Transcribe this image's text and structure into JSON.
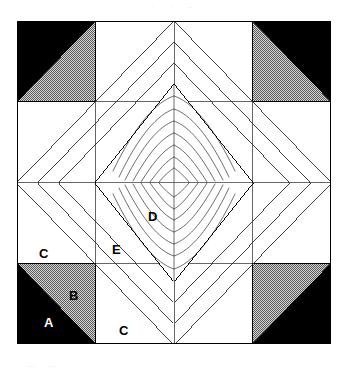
{
  "figure": {
    "kind": "quilt-block-diagram",
    "title_fragment_top": "·   ·   -",
    "caption_fragment_bottom": "_        _"
  },
  "canvas": {
    "width": 348,
    "height": 369,
    "background": "#ffffff"
  },
  "block": {
    "x": 17,
    "y": 21,
    "width": 314,
    "height": 323,
    "grid_columns": 4,
    "grid_rows": 4,
    "outline_color": "#000000"
  },
  "colors": {
    "fabric_a_black": "#000000",
    "fabric_b_gray_stipple": "#9a9a9a",
    "fabric_c_white": "#ffffff",
    "band_gray": "#8c8c8c",
    "band_stripe_dark": "#4f4f4f",
    "quilting_line": "#555555",
    "outline": "#000000",
    "text_dark": "#000000",
    "text_light": "#ffffff"
  },
  "patch_labels": [
    {
      "id": "A",
      "text": "A",
      "x": 44,
      "y": 316,
      "on_dark": true,
      "describes": "black half-square-triangle in corner unit"
    },
    {
      "id": "B",
      "text": "B",
      "x": 69,
      "y": 289,
      "on_dark": false,
      "describes": "gray stippled half-square-triangle in corner unit"
    },
    {
      "id": "C_bottom",
      "text": "C",
      "x": 119,
      "y": 324,
      "on_dark": false,
      "describes": "white background square, bottom edge"
    },
    {
      "id": "C_left",
      "text": "C",
      "x": 39,
      "y": 247,
      "on_dark": false,
      "describes": "white background square, left edge"
    },
    {
      "id": "D",
      "text": "D",
      "x": 148,
      "y": 210,
      "on_dark": false,
      "describes": "white center diamond with feathered fan quilting"
    },
    {
      "id": "E",
      "text": "E",
      "x": 112,
      "y": 243,
      "on_dark": false,
      "describes": "striped diagonal border band of the diamond"
    }
  ],
  "corner_units": [
    {
      "position": "top-left",
      "black_corner": "top-left",
      "gray_corner": "bottom-right"
    },
    {
      "position": "top-right",
      "black_corner": "top-right",
      "gray_corner": "bottom-left"
    },
    {
      "position": "bottom-left",
      "black_corner": "bottom-left",
      "gray_corner": "top-right"
    },
    {
      "position": "bottom-right",
      "black_corner": "bottom-right",
      "gray_corner": "top-left"
    }
  ],
  "diamond": {
    "description": "on-point square medallion spanning the block, built from concentric striped bands",
    "band_count": 3,
    "center_patch": "white diamond with radiating feather quilting lines",
    "quilting_rays_per_quadrant": 9
  }
}
